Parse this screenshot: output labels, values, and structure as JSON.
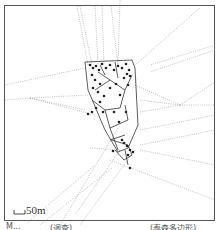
{
  "figure": {
    "type": "voronoi-map",
    "scale_bar": {
      "label": "50m"
    },
    "captions": {
      "left": "M...",
      "middle": "(调查)",
      "right": "(泰森多边形)"
    },
    "colors": {
      "frame": "#555555",
      "solid_edges": "#333333",
      "dotted_edges": "#888888",
      "points": "#222222"
    }
  }
}
